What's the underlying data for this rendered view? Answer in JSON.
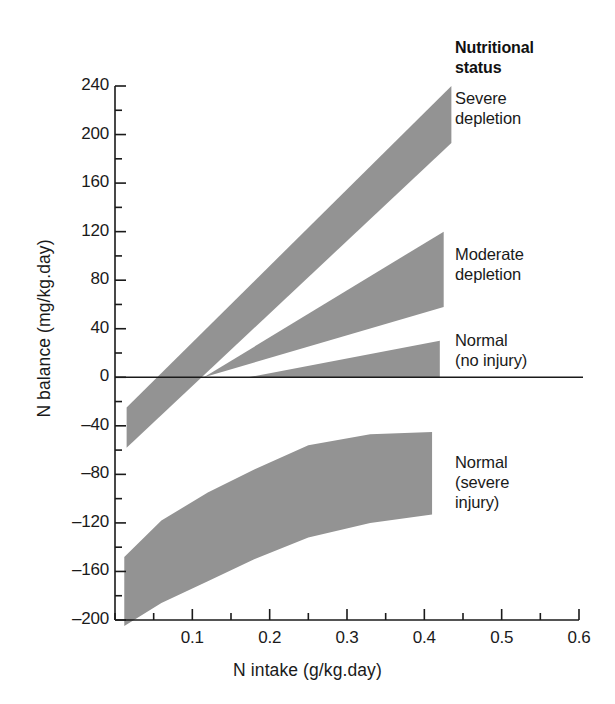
{
  "chart_data": {
    "type": "area",
    "title": "",
    "xlabel": "N intake (g/kg.day)",
    "ylabel": "N balance (mg/kg.day)",
    "xlim": [
      0.0,
      0.6
    ],
    "ylim": [
      -200,
      240
    ],
    "x_ticks": [
      0.1,
      0.2,
      0.3,
      0.4,
      0.5,
      0.6
    ],
    "x_tick_labels": [
      "0.1",
      "0.2",
      "0.3",
      "0.4",
      "0.5",
      "0.6"
    ],
    "x_minor_tick_step": 0.05,
    "y_ticks": [
      240,
      200,
      160,
      120,
      80,
      40,
      0,
      -40,
      -80,
      -120,
      -160,
      -200
    ],
    "y_tick_labels": [
      "240",
      "200",
      "160",
      "120",
      "80",
      "40",
      "0",
      "-40",
      "-80",
      "-120",
      "-160",
      "-200"
    ],
    "y_minor_tick_step": 20,
    "grid": false,
    "zero_line": true,
    "legend_position": "right",
    "band_color": "#939393",
    "axis_color": "#1a1a1a",
    "legend_title": "Nutritional status",
    "series": [
      {
        "name": "Severe depletion",
        "legend_label_lines": [
          "Severe",
          "depletion"
        ],
        "x": [
          0.015,
          0.435
        ],
        "upper": [
          -25,
          240
        ],
        "lower": [
          -58,
          193
        ],
        "x_start": 0.015,
        "x_end": 0.435,
        "y_start_range": [
          -58,
          -25
        ],
        "y_end_range": [
          193,
          240
        ]
      },
      {
        "name": "Moderate depletion",
        "legend_label_lines": [
          "Moderate",
          "depletion"
        ],
        "x": [
          0.115,
          0.425
        ],
        "upper": [
          0,
          120
        ],
        "lower": [
          0,
          58
        ],
        "x_start": 0.115,
        "x_end": 0.425,
        "y_start_range": [
          0,
          0
        ],
        "y_end_range": [
          58,
          120
        ]
      },
      {
        "name": "Normal (no injury)",
        "legend_label_lines": [
          "Normal",
          "(no injury)"
        ],
        "x": [
          0.172,
          0.42
        ],
        "upper": [
          0,
          30
        ],
        "lower": [
          0,
          0
        ],
        "x_start": 0.172,
        "x_end": 0.42,
        "y_start_range": [
          0,
          0
        ],
        "y_end_range": [
          0,
          30
        ]
      },
      {
        "name": "Normal (severe injury)",
        "legend_label_lines": [
          "Normal",
          "(severe",
          "injury)"
        ],
        "x": [
          0.012,
          0.06,
          0.12,
          0.18,
          0.25,
          0.33,
          0.41
        ],
        "upper": [
          -148,
          -118,
          -95,
          -76,
          -56,
          -47,
          -45
        ],
        "lower": [
          -205,
          -186,
          -168,
          -150,
          -132,
          -120,
          -113
        ],
        "x_start": 0.012,
        "x_end": 0.41,
        "y_start_range": [
          -205,
          -148
        ],
        "y_end_range": [
          -113,
          -45
        ]
      }
    ]
  },
  "axes": {
    "y_title": "N balance (mg/kg.day)",
    "x_title": "N intake (g/kg.day)",
    "y_tick_labels": [
      "240",
      "200",
      "160",
      "120",
      "80",
      "40",
      "0",
      "‒40",
      "‒80",
      "‒120",
      "‒160",
      "‒200"
    ],
    "x_tick_labels": [
      "0.1",
      "0.2",
      "0.3",
      "0.4",
      "0.5",
      "0.6"
    ]
  },
  "legend": {
    "title_line1": "Nutritional",
    "title_line2": "status",
    "entries": [
      {
        "id": "severe-depletion",
        "line1": "Severe",
        "line2": "depletion",
        "line3": ""
      },
      {
        "id": "moderate-depletion",
        "line1": "Moderate",
        "line2": "depletion",
        "line3": ""
      },
      {
        "id": "normal-no-injury",
        "line1": "Normal",
        "line2": "(no injury)",
        "line3": ""
      },
      {
        "id": "normal-severe-injury",
        "line1": "Normal",
        "line2": "(severe",
        "line3": "injury)"
      }
    ]
  },
  "colors": {
    "band": "#939393",
    "axis": "#1a1a1a",
    "background": "#ffffff",
    "text": "#1a1a1a"
  }
}
